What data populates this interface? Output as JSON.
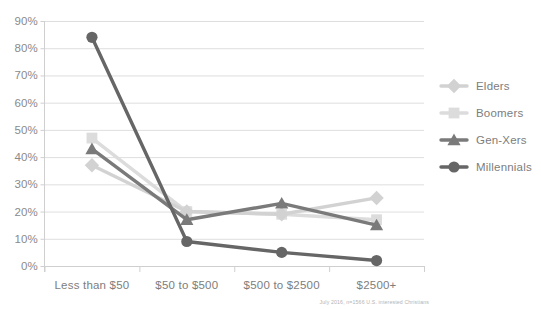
{
  "chart_data": {
    "type": "line",
    "title": "",
    "subtitle": "",
    "xlabel": "",
    "ylabel": "",
    "categories": [
      "Less than $50",
      "$50 to $500",
      "$500 to $2500",
      "$2500+"
    ],
    "ylim": [
      0,
      90
    ],
    "ytick_step": 10,
    "ytick_labels": [
      "0%",
      "10%",
      "20%",
      "30%",
      "40%",
      "50%",
      "60%",
      "70%",
      "80%",
      "90%"
    ],
    "ytick_values": [
      0,
      10,
      20,
      30,
      40,
      50,
      60,
      70,
      80,
      90
    ],
    "grid": true,
    "legend_position": "right",
    "series": [
      {
        "name": "Elders",
        "values": [
          37,
          20,
          19,
          25
        ],
        "color": "#d2d2d2",
        "marker": "diamond"
      },
      {
        "name": "Boomers",
        "values": [
          47,
          20,
          19,
          17
        ],
        "color": "#dcdcdc",
        "marker": "square"
      },
      {
        "name": "Gen-Xers",
        "values": [
          43,
          17,
          23,
          15
        ],
        "color": "#7a7a7a",
        "marker": "triangle"
      },
      {
        "name": "Millennials",
        "values": [
          84,
          9,
          5,
          2
        ],
        "color": "#666666",
        "marker": "circle"
      }
    ],
    "annotations": {
      "source": "July 2016, n=1566 U.S. interested Christians"
    }
  },
  "legend": {
    "entries": [
      {
        "label": "Elders"
      },
      {
        "label": "Boomers"
      },
      {
        "label": "Gen-Xers"
      },
      {
        "label": "Millennials"
      }
    ]
  },
  "footer": {
    "source_note": "July 2016, n=1566 U.S. interested Christians"
  }
}
